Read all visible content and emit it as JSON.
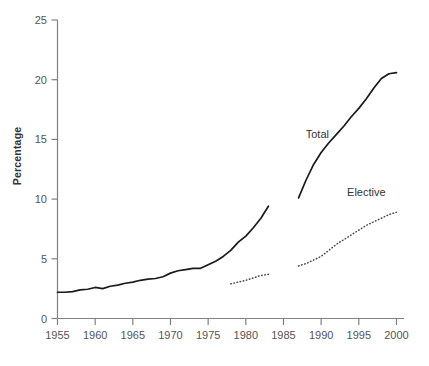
{
  "chart_data": {
    "type": "line",
    "title": "",
    "xlabel": "",
    "ylabel": "Percentage",
    "xlim": [
      1955,
      2001
    ],
    "ylim": [
      0,
      25
    ],
    "grid": false,
    "legend_position": "inline-annotations",
    "xticks": [
      1955,
      1960,
      1965,
      1970,
      1975,
      1980,
      1985,
      1990,
      1995,
      2000
    ],
    "yticks": [
      0,
      5,
      10,
      15,
      20,
      25
    ],
    "annotations": [
      {
        "text": "Total",
        "x": 1989.5,
        "y": 15.1
      },
      {
        "text": "Elective",
        "x": 1996.0,
        "y": 10.3
      }
    ],
    "series": [
      {
        "name": "Total",
        "style": "solid",
        "color": "#1a1a1a",
        "segments": [
          {
            "x": [
              1955,
              1956,
              1957,
              1958,
              1959,
              1960,
              1961,
              1962,
              1963,
              1964,
              1965,
              1966,
              1967,
              1968,
              1969,
              1970,
              1971,
              1972,
              1973,
              1974,
              1975,
              1976,
              1977,
              1978,
              1979,
              1980,
              1981,
              1982,
              1983
            ],
            "y": [
              2.2,
              2.2,
              2.25,
              2.4,
              2.45,
              2.6,
              2.5,
              2.7,
              2.8,
              2.95,
              3.05,
              3.2,
              3.3,
              3.35,
              3.5,
              3.8,
              4.0,
              4.1,
              4.2,
              4.2,
              4.5,
              4.8,
              5.2,
              5.7,
              6.4,
              6.9,
              7.6,
              8.4,
              9.4
            ]
          },
          {
            "x": [
              1987,
              1988,
              1989,
              1990,
              1991,
              1992,
              1993,
              1994,
              1995,
              1996,
              1997,
              1998,
              1999,
              2000
            ],
            "y": [
              10.1,
              11.6,
              12.9,
              13.9,
              14.7,
              15.4,
              16.1,
              16.9,
              17.6,
              18.4,
              19.3,
              20.1,
              20.5,
              20.6
            ]
          }
        ]
      },
      {
        "name": "Elective",
        "style": "dotted",
        "color": "#4d4d4d",
        "segments": [
          {
            "x": [
              1978,
              1979,
              1980,
              1981,
              1982,
              1983
            ],
            "y": [
              2.9,
              3.05,
              3.2,
              3.4,
              3.6,
              3.7
            ]
          },
          {
            "x": [
              1987,
              1988,
              1989,
              1990,
              1991,
              1992,
              1993,
              1994,
              1995,
              1996,
              1997,
              1998,
              1999,
              2000
            ],
            "y": [
              4.4,
              4.6,
              4.9,
              5.2,
              5.7,
              6.2,
              6.6,
              7.0,
              7.4,
              7.8,
              8.1,
              8.4,
              8.7,
              8.9
            ]
          }
        ]
      }
    ]
  },
  "axis": {
    "y_title": "Percentage"
  }
}
